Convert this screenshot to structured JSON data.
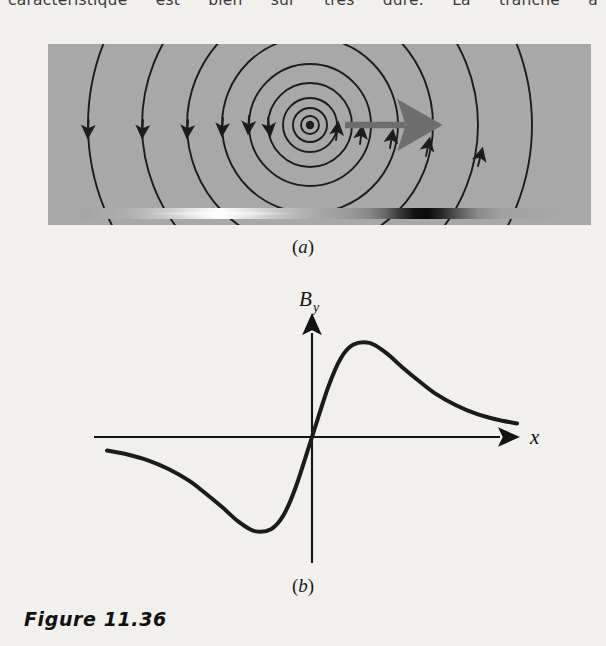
{
  "page": {
    "background_color": "#f2f1ee",
    "body_text_above": "caractéristique est bien sûr très dure. La tranche a"
  },
  "figure": {
    "caption": "Figure 11.36",
    "panels": [
      {
        "id": "a",
        "label": "(a)",
        "open_paren": "(",
        "letter": "a",
        "close_paren": ")",
        "description": "magnetic field lines around a current-carrying wire over a conducting slab",
        "background_color": "#a9a9a9",
        "line_color": "#1c1c1c",
        "arrow_color": "#6e6e6e",
        "source_point": {
          "x": 310,
          "y": 125,
          "marker": "current-out-of-page-dot"
        },
        "velocity_arrow": {
          "from_x": 345,
          "to_x": 412,
          "y": 125,
          "direction": "right"
        },
        "gradient_strip": {
          "y": 208,
          "height": 11,
          "bright_center_x": 208,
          "dark_center_x": 385
        }
      },
      {
        "id": "b",
        "label": "(b)",
        "open_paren": "(",
        "letter": "b",
        "close_paren": ")",
        "description": "plot of the vertical magnetic field component versus horizontal position"
      }
    ]
  },
  "chart_data": {
    "type": "line",
    "title": "",
    "subtitle": "",
    "xlabel": "x",
    "ylabel": "B_y",
    "ylabel_base": "B",
    "ylabel_sub": "y",
    "grid": false,
    "legend": null,
    "axes": {
      "x_axis": {
        "from_x": 94,
        "to_x": 508,
        "y": 437,
        "arrow": "right"
      },
      "y_axis": {
        "x": 312,
        "from_y": 563,
        "to_y": 325,
        "arrow": "up"
      },
      "origin": {
        "x": 312,
        "y": 437
      }
    },
    "xlim": [
      -5,
      5
    ],
    "ylim": [
      -1.1,
      1.1
    ],
    "x": [
      -5.0,
      -4.5,
      -4.0,
      -3.5,
      -3.0,
      -2.6,
      -2.2,
      -1.8,
      -1.4,
      -1.0,
      -0.7,
      -0.4,
      0.0,
      0.4,
      0.7,
      1.0,
      1.4,
      1.8,
      2.2,
      2.6,
      3.0,
      3.5,
      4.0,
      4.5,
      5.0
    ],
    "values": [
      -0.14,
      -0.18,
      -0.24,
      -0.33,
      -0.45,
      -0.58,
      -0.72,
      -0.87,
      -0.97,
      -0.95,
      -0.81,
      -0.52,
      0.0,
      0.52,
      0.81,
      0.95,
      0.97,
      0.87,
      0.72,
      0.58,
      0.45,
      0.33,
      0.24,
      0.18,
      0.14
    ],
    "annotations": [
      {
        "text": "minimum",
        "x": -1.25,
        "y": -0.99
      },
      {
        "text": "maximum",
        "x": 1.25,
        "y": 0.99
      },
      {
        "text": "zero crossing",
        "x": 0.0,
        "y": 0.0
      }
    ],
    "curve_color": "#1b1b1b",
    "curve_width": 4
  }
}
